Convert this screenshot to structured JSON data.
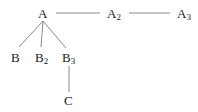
{
  "diagram": {
    "type": "tree",
    "nodes": {
      "A": {
        "base": "A",
        "sub": ""
      },
      "A2": {
        "base": "A",
        "sub": "2"
      },
      "A3": {
        "base": "A",
        "sub": "3"
      },
      "B": {
        "base": "B",
        "sub": ""
      },
      "B2": {
        "base": "B",
        "sub": "2"
      },
      "B3": {
        "base": "B",
        "sub": "3"
      },
      "C": {
        "base": "C",
        "sub": ""
      }
    },
    "edges": [
      [
        "A",
        "A2"
      ],
      [
        "A2",
        "A3"
      ],
      [
        "A",
        "B"
      ],
      [
        "A",
        "B2"
      ],
      [
        "A",
        "B3"
      ],
      [
        "B3",
        "C"
      ]
    ],
    "colors": {
      "text": "#1a1a1a",
      "edge": "#7a7a7a",
      "background": "#ffffff"
    }
  }
}
